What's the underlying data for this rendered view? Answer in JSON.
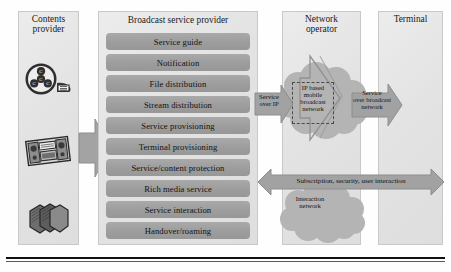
{
  "diagram": {
    "columns": [
      {
        "id": "contents-provider",
        "label": "Contents\nprovider",
        "line1": "Contents",
        "line2": "provider"
      },
      {
        "id": "broadcast-service-provider",
        "label": "Broadcast service provider",
        "line1": "Broadcast service provider",
        "line2": ""
      },
      {
        "id": "network-operator",
        "label": "Network operator",
        "line1": "Network",
        "line2": "operator"
      },
      {
        "id": "terminal",
        "label": "Terminal",
        "line1": "Terminal",
        "line2": ""
      }
    ],
    "content_icons": [
      {
        "name": "film-reel-icon",
        "label": "film reel"
      },
      {
        "name": "stereo-radio-icon",
        "label": "stereo radio"
      },
      {
        "name": "books-stack-icon",
        "label": "stack of books"
      }
    ],
    "services": [
      "Service guide",
      "Notification",
      "File distribution",
      "Stream distribution",
      "Service provisioning",
      "Terminal provisioning",
      "Service/content protection",
      "Rich media service",
      "Service interaction",
      "Handover/roaming"
    ],
    "flows": [
      {
        "id": "content-to-provider",
        "label": "",
        "direction": "right"
      },
      {
        "id": "service-over-ip",
        "label": "Service\nover IP",
        "line1": "Service",
        "line2": "over IP",
        "direction": "right"
      },
      {
        "id": "service-over-broadcast-network",
        "label": "Service\nover broadcast\nnetwork",
        "line1": "Service",
        "line2": "over broadcast",
        "line3": "network",
        "direction": "right"
      },
      {
        "id": "subscription-security-user-interaction",
        "label": "Subscription, security, user interaction",
        "direction": "both"
      }
    ],
    "networks": [
      {
        "id": "ip-based-mobile-broadcast-network",
        "line1": "IP based",
        "line2": "mobile",
        "line3": "broadcast",
        "line4": "network"
      },
      {
        "id": "interaction-network",
        "line1": "Interaction",
        "line2": "network"
      }
    ],
    "colors": {
      "panel_fill": "#e6e6e6",
      "panel_border": "#c9c9c9",
      "row_fill": "#9f9f9f",
      "arrow_fill": "#9e9e9e",
      "cloud_fill": "#b6b6b6",
      "text": "#111111",
      "rule": "#101010"
    }
  }
}
